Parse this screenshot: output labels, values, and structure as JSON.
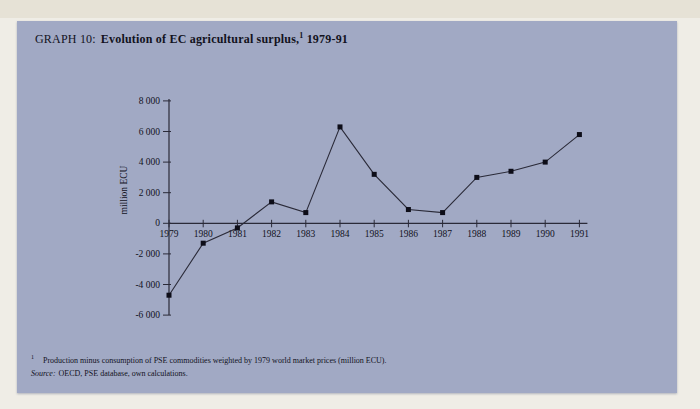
{
  "page": {
    "title_prefix": "GRAPH 10:",
    "title_main": "Evolution of EC agricultural surplus,",
    "title_superscript": "1",
    "title_suffix": "1979-91"
  },
  "footnotes": {
    "note_marker": "1",
    "note_text": "Production minus consumption of PSE commodities weighted by 1979 world market prices (million ECU).",
    "source_label": "Source:",
    "source_text": "OECD, PSE database, own calculations."
  },
  "colors": {
    "panel_background": "#a1a9c4",
    "page_background": "#efede6",
    "ink": "#12121d",
    "line_color": "#2a2a38",
    "marker_color": "#0d0d18"
  },
  "chart_data": {
    "type": "line",
    "xlabel": "",
    "ylabel": "million ECU",
    "x": [
      1979,
      1980,
      1981,
      1982,
      1983,
      1984,
      1985,
      1986,
      1987,
      1988,
      1989,
      1990,
      1991
    ],
    "y": [
      -4700,
      -1300,
      -300,
      1400,
      700,
      6300,
      3200,
      900,
      700,
      3000,
      3400,
      4000,
      5800
    ],
    "x_tick_labels": [
      "1979",
      "1980",
      "1981",
      "1982",
      "1983",
      "1984",
      "1985",
      "1986",
      "1987",
      "1988",
      "1989",
      "1990",
      "1991"
    ],
    "y_tick_values": [
      8000,
      6000,
      4000,
      2000,
      0,
      -2000,
      -4000,
      -6000
    ],
    "y_tick_labels": [
      "8 000",
      "6 000",
      "4 000",
      "2 000",
      "0",
      "-2 000",
      "-4 000",
      "-6 000"
    ],
    "ylim": [
      -6000,
      8000
    ],
    "grid": false,
    "legend": "none",
    "marker": "square"
  }
}
